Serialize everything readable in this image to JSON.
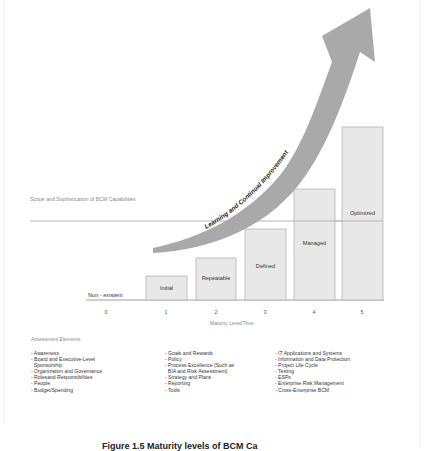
{
  "diagram": {
    "scope_label": "Scope and Sophistication of BCM Capabilities",
    "arrow_label": "Learning and Continual Improvement",
    "baseline_label": "Non - existent",
    "x_axis_label": "Maturity Level/Time",
    "x_ticks": [
      "0",
      "1",
      "2",
      "3",
      "4",
      "5"
    ],
    "levels": [
      {
        "level": 1,
        "label": "Initial"
      },
      {
        "level": 2,
        "label": "Repeatable"
      },
      {
        "level": 3,
        "label": "Defined"
      },
      {
        "level": 4,
        "label": "Managed"
      },
      {
        "level": 5,
        "label": "Optimized"
      }
    ],
    "colors": {
      "bar_fill": "#e8e8e8",
      "bar_stroke": "#b5b5b5",
      "arrow": "#a9a9a9",
      "scope_line": "#b5b5b5"
    }
  },
  "assessment": {
    "title": "Assessment Elements",
    "columns": [
      [
        "- Awareness",
        "- Board and Executive-Level",
        "  Sponsorship",
        "- Organization and Governance",
        "- Rolesand Responsibilities",
        "- People",
        "- Budget/Spending"
      ],
      [
        "- Goals and Rewards",
        "- Policy",
        "- Process Excellence (Such as",
        "  BIA and Risk Assessment)",
        "- Strategy and Plans",
        "- Reporting",
        "- Tools"
      ],
      [
        "- IT Applications and Systems",
        "- Information and Data Protection",
        "- Project Life Cycle",
        "- Testing",
        "- ESPs",
        "- Enterprise Risk Management",
        "- Cross-Enterprise BCM"
      ]
    ]
  },
  "caption": "Figure 1.5  Maturity levels of BCM Ca"
}
